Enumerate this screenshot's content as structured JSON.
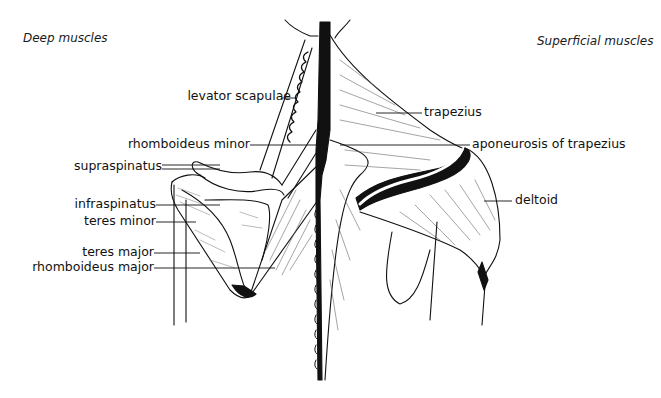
{
  "diagram": {
    "type": "anatomical-illustration",
    "panels": {
      "left": {
        "title": "Deep muscles"
      },
      "right": {
        "title": "Superficial muscles"
      }
    },
    "labels": {
      "left": [
        {
          "id": "levator-scapulae",
          "text": "levator scapulae"
        },
        {
          "id": "rhomboideus-minor",
          "text": "rhomboideus minor"
        },
        {
          "id": "supraspinatus",
          "text": "supraspinatus"
        },
        {
          "id": "infraspinatus",
          "text": "infraspinatus"
        },
        {
          "id": "teres-minor",
          "text": "teres minor"
        },
        {
          "id": "teres-major",
          "text": "teres major"
        },
        {
          "id": "rhomboideus-major",
          "text": "rhomboideus major"
        }
      ],
      "right": [
        {
          "id": "trapezius",
          "text": "trapezius"
        },
        {
          "id": "aponeurosis-of-trapezius",
          "text": "aponeurosis of trapezius"
        },
        {
          "id": "deltoid",
          "text": "deltoid"
        }
      ]
    },
    "colors": {
      "ink": "#111111",
      "background": "#ffffff",
      "hatch": "#555555"
    }
  }
}
